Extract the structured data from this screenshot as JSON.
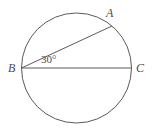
{
  "figure": {
    "type": "circle-geometry-diagram",
    "background_color": "#ffffff",
    "stroke_color": "#5a5a5a",
    "text_color": "#4a4a4a",
    "circle": {
      "center_x": 76.5,
      "center_y": 68,
      "radius": 55
    },
    "points": [
      {
        "id": "A",
        "label": "A",
        "x": 112,
        "y": 26
      },
      {
        "id": "B",
        "label": "B",
        "x": 21.5,
        "y": 68
      },
      {
        "id": "C",
        "label": "C",
        "x": 131.5,
        "y": 68
      }
    ],
    "segments": [
      {
        "id": "diameter-BC",
        "from": "B",
        "to": "C"
      },
      {
        "id": "chord-BA",
        "from": "B",
        "to": "A"
      }
    ],
    "angle": {
      "id": "angle-ABC",
      "vertex": "B",
      "label": "30°",
      "value": 30,
      "unit": "degrees"
    }
  }
}
